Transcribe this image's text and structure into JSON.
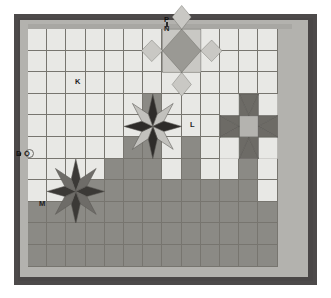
{
  "figure": {
    "kind": "quilt-design-layout",
    "frame_color": "#4d4a4a",
    "mat_color": "#b3b2ae",
    "field_background": "#e8e8e5"
  },
  "palette": {
    "light_square": "#e8e8e5",
    "dark_square": "#8b8a85",
    "mid_gray": "#9a9994",
    "star_dark": "#2e2c2a",
    "star_medium": "#5f5d59",
    "star_light": "#c9c8c4",
    "grid_line": "#6e6c66",
    "label_text": "#1e1e1e"
  },
  "labels": [
    {
      "id": "P",
      "text": "P",
      "x": 164,
      "y": 16,
      "target": "outer-frame"
    },
    {
      "id": "N",
      "text": "N",
      "x": 164,
      "y": 25,
      "target": "inner-mat-top"
    },
    {
      "id": "K",
      "text": "K",
      "x": 75,
      "y": 78,
      "target": "light-background-square"
    },
    {
      "id": "L",
      "text": "L",
      "x": 190,
      "y": 121,
      "target": "dark-background-square"
    },
    {
      "id": "M",
      "text": "M",
      "x": 39,
      "y": 200,
      "target": "dark-background-square"
    },
    {
      "id": "D",
      "text": "D",
      "x": 16,
      "y": 150,
      "target": "outer-frame-left"
    },
    {
      "id": "O",
      "text": "O",
      "x": 24,
      "y": 150,
      "target": "inner-mat-left"
    }
  ],
  "grid": {
    "columns": 13,
    "rows": 11,
    "cell_width": 19.2,
    "cell_height": 21.6,
    "origin_x": 28,
    "origin_y": 29,
    "line_color": "#6e6c66"
  },
  "cells_dark": [
    [
      6,
      3
    ],
    [
      6,
      4
    ],
    [
      5,
      5
    ],
    [
      6,
      5
    ],
    [
      8,
      5
    ],
    [
      11,
      5
    ],
    [
      4,
      6
    ],
    [
      5,
      6
    ],
    [
      6,
      6
    ],
    [
      8,
      6
    ],
    [
      11,
      6
    ],
    [
      3,
      7
    ],
    [
      4,
      7
    ],
    [
      5,
      7
    ],
    [
      6,
      7
    ],
    [
      7,
      7
    ],
    [
      8,
      7
    ],
    [
      9,
      7
    ],
    [
      10,
      7
    ],
    [
      11,
      7
    ],
    [
      0,
      8
    ],
    [
      1,
      8
    ],
    [
      2,
      8
    ],
    [
      3,
      8
    ],
    [
      4,
      8
    ],
    [
      5,
      8
    ],
    [
      6,
      8
    ],
    [
      7,
      8
    ],
    [
      8,
      8
    ],
    [
      9,
      8
    ],
    [
      10,
      8
    ],
    [
      11,
      8
    ],
    [
      12,
      8
    ],
    [
      0,
      9
    ],
    [
      1,
      9
    ],
    [
      2,
      9
    ],
    [
      3,
      9
    ],
    [
      4,
      9
    ],
    [
      5,
      9
    ],
    [
      6,
      9
    ],
    [
      7,
      9
    ],
    [
      8,
      9
    ],
    [
      9,
      9
    ],
    [
      10,
      9
    ],
    [
      11,
      9
    ],
    [
      12,
      9
    ],
    [
      0,
      10
    ],
    [
      1,
      10
    ],
    [
      2,
      10
    ],
    [
      3,
      10
    ],
    [
      4,
      10
    ],
    [
      5,
      10
    ],
    [
      6,
      10
    ],
    [
      7,
      10
    ],
    [
      8,
      10
    ],
    [
      9,
      10
    ],
    [
      10,
      10
    ],
    [
      11,
      10
    ],
    [
      12,
      10
    ]
  ],
  "motifs": [
    {
      "name": "square-on-point-block",
      "type": "diamond",
      "label_ref": "N",
      "col": 7,
      "row": 0,
      "span_cols": 2,
      "span_rows": 2,
      "center_fill": "#9a9994",
      "corner_fill": "#c9c8c4"
    },
    {
      "name": "lemoyne-star-center",
      "type": "eight-point-star",
      "col": 5,
      "row": 3,
      "span_cols": 3,
      "span_rows": 3,
      "alternating_fills": [
        "#2e2c2a",
        "#c2c1bd"
      ],
      "background": "#e8e8e5"
    },
    {
      "name": "lemoyne-star-lower-left",
      "type": "eight-point-star",
      "label_ref": "M",
      "col": 1,
      "row": 6,
      "span_cols": 3,
      "span_rows": 3,
      "alternating_fills": [
        "#3b3936",
        "#6e6c68"
      ],
      "background": "#e8e8e5"
    },
    {
      "name": "sawtooth-star-right",
      "type": "ohio-star",
      "col": 10,
      "row": 3,
      "span_cols": 3,
      "span_rows": 3,
      "point_fill": "#6d6b66",
      "center_fill": "#b4b3af",
      "background": "#e8e8e5"
    }
  ]
}
